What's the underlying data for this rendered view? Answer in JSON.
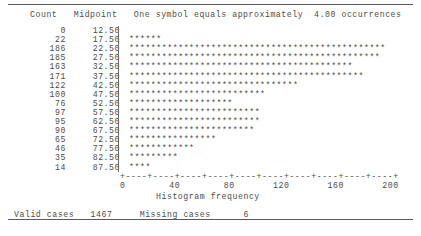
{
  "report": {
    "columns": {
      "count_header": "Count",
      "midpoint_header": "Midpoint",
      "symbol_note": "One symbol equals approximately  4.00 occurrences"
    },
    "symbol_char": "*",
    "symbol_scale": 4.0,
    "axis": {
      "ticks_line": "+----+----+----+----+----+----+----+----+----+----+",
      "labels_line": "0        40        80       120       160       200",
      "title": "Histogram frequency",
      "tick_values": [
        0,
        40,
        80,
        120,
        160,
        200
      ],
      "min": 0,
      "max": 200
    },
    "footer": {
      "valid_label": "Valid cases",
      "valid_value": "1467",
      "missing_label": "Missing cases",
      "missing_value": "6"
    }
  },
  "chart_data": {
    "type": "bar",
    "title": "",
    "subtitle": "One symbol equals approximately  4.00 occurrences",
    "xlabel": "Histogram frequency",
    "ylabel": "Midpoint",
    "orientation": "horizontal",
    "xlim": [
      0,
      200
    ],
    "grid": false,
    "legend": false,
    "categories": [
      "12.50",
      "17.50",
      "22.50",
      "27.50",
      "32.50",
      "37.50",
      "42.50",
      "47.50",
      "52.50",
      "57.50",
      "62.50",
      "67.50",
      "72.50",
      "77.50",
      "82.50",
      "87.50"
    ],
    "values": [
      0,
      22,
      186,
      185,
      163,
      171,
      122,
      100,
      76,
      97,
      95,
      90,
      65,
      46,
      35,
      14
    ],
    "symbols_per_row": [
      0,
      6,
      47,
      46,
      41,
      43,
      31,
      25,
      19,
      24,
      24,
      23,
      16,
      12,
      9,
      4
    ],
    "rows": [
      {
        "count": "0",
        "midpoint": "12.50",
        "symbols": 0
      },
      {
        "count": "22",
        "midpoint": "17.50",
        "symbols": 6
      },
      {
        "count": "186",
        "midpoint": "22.50",
        "symbols": 47
      },
      {
        "count": "185",
        "midpoint": "27.50",
        "symbols": 46
      },
      {
        "count": "163",
        "midpoint": "32.50",
        "symbols": 41
      },
      {
        "count": "171",
        "midpoint": "37.50",
        "symbols": 43
      },
      {
        "count": "122",
        "midpoint": "42.50",
        "symbols": 31
      },
      {
        "count": "100",
        "midpoint": "47.50",
        "symbols": 25
      },
      {
        "count": "76",
        "midpoint": "52.50",
        "symbols": 19
      },
      {
        "count": "97",
        "midpoint": "57.50",
        "symbols": 24
      },
      {
        "count": "95",
        "midpoint": "62.50",
        "symbols": 24
      },
      {
        "count": "90",
        "midpoint": "67.50",
        "symbols": 23
      },
      {
        "count": "65",
        "midpoint": "72.50",
        "symbols": 16
      },
      {
        "count": "46",
        "midpoint": "77.50",
        "symbols": 12
      },
      {
        "count": "35",
        "midpoint": "82.50",
        "symbols": 9
      },
      {
        "count": "14",
        "midpoint": "87.50",
        "symbols": 4
      }
    ]
  }
}
